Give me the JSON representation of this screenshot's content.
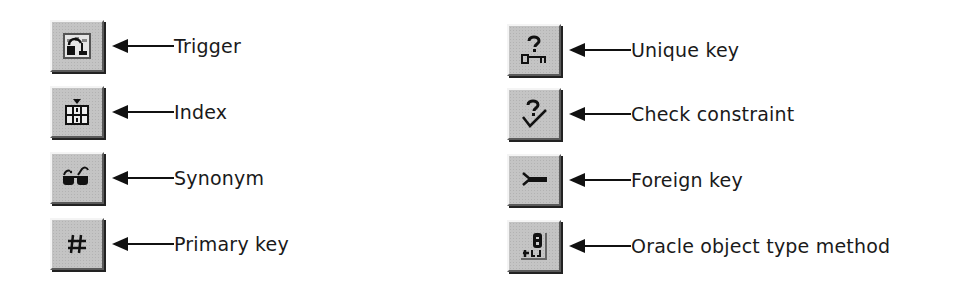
{
  "legend": {
    "left_column": [
      {
        "icon": "trigger-icon",
        "label": "Trigger"
      },
      {
        "icon": "index-icon",
        "label": "Index"
      },
      {
        "icon": "synonym-icon",
        "label": "Synonym"
      },
      {
        "icon": "primary-key-icon",
        "label": "Primary key"
      }
    ],
    "right_column": [
      {
        "icon": "unique-key-icon",
        "label": "Unique key"
      },
      {
        "icon": "check-constraint-icon",
        "label": "Check constraint"
      },
      {
        "icon": "foreign-key-icon",
        "label": "Foreign key"
      },
      {
        "icon": "object-type-method-icon",
        "label": "Oracle object type method"
      }
    ]
  }
}
